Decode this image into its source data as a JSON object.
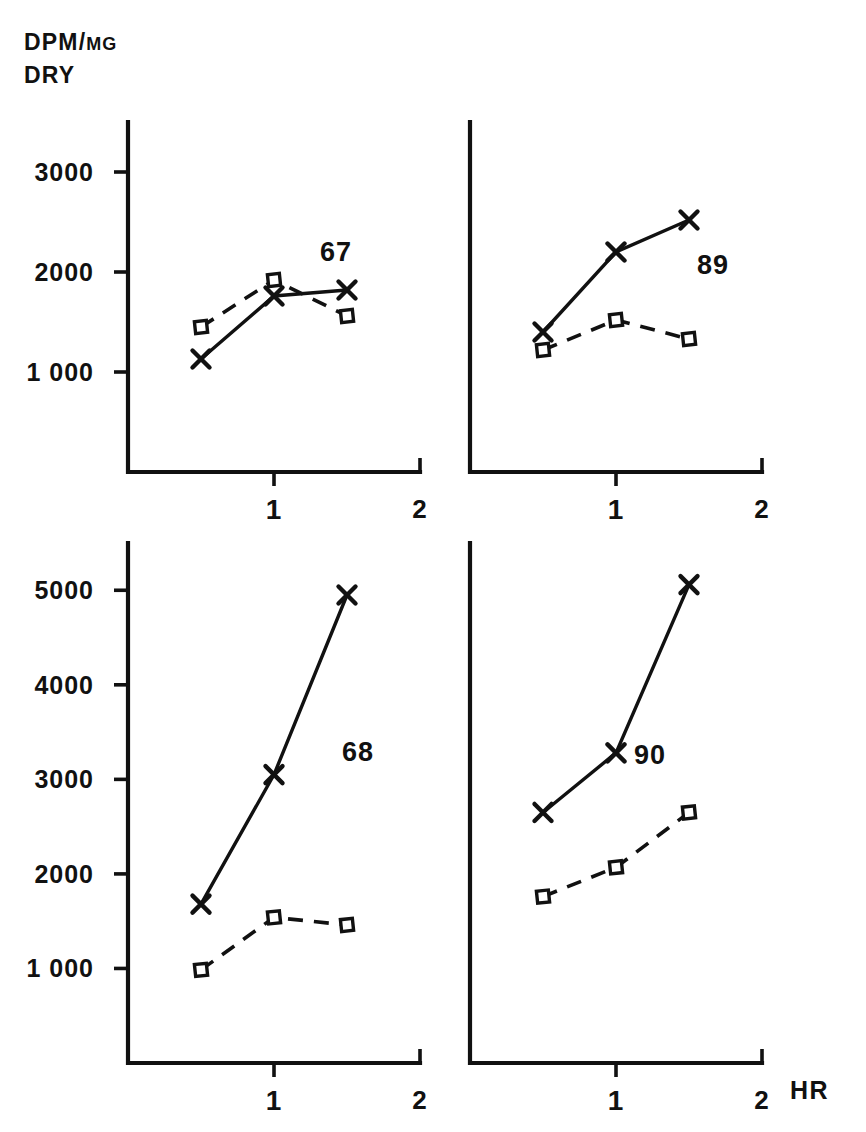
{
  "figure": {
    "y_axis_title_line1": "DPM/",
    "y_axis_title_unit": "MG",
    "y_axis_title_line2": "DRY",
    "x_axis_unit_label": "HR"
  },
  "chart_data": {
    "type": "line",
    "xlabel": "HR",
    "ylabel": "DPM/MG DRY",
    "grid": false,
    "legend_position": "none",
    "x": [
      0.5,
      1.0,
      1.5
    ],
    "panels": [
      {
        "label": "67",
        "row": 0,
        "col": 0,
        "xlim": [
          0,
          2
        ],
        "ylim": [
          0,
          3500
        ],
        "xticks": [
          "1",
          "2"
        ],
        "xtick_values": [
          1,
          2
        ],
        "yticks": [
          "3000",
          "2000",
          "1 000"
        ],
        "ytick_values": [
          3000,
          2000,
          1000
        ],
        "series": [
          {
            "name": "x-series",
            "marker": "x",
            "line": "solid",
            "values": [
              1130,
              1760,
              1820
            ]
          },
          {
            "name": "square-series",
            "marker": "square",
            "line": "dashed",
            "values": [
              1450,
              1920,
              1560
            ]
          }
        ]
      },
      {
        "label": "89",
        "row": 0,
        "col": 1,
        "xlim": [
          0,
          2
        ],
        "ylim": [
          0,
          3500
        ],
        "xticks": [
          "1",
          "2"
        ],
        "xtick_values": [
          1,
          2
        ],
        "yticks": [],
        "ytick_values": [],
        "series": [
          {
            "name": "x-series",
            "marker": "x",
            "line": "solid",
            "values": [
              1400,
              2200,
              2520
            ]
          },
          {
            "name": "square-series",
            "marker": "square",
            "line": "dashed",
            "values": [
              1220,
              1520,
              1330
            ]
          }
        ]
      },
      {
        "label": "68",
        "row": 1,
        "col": 0,
        "xlim": [
          0,
          2
        ],
        "ylim": [
          0,
          5500
        ],
        "xticks": [
          "1",
          "2"
        ],
        "xtick_values": [
          1,
          2
        ],
        "yticks": [
          "5000",
          "4000",
          "3000",
          "2000",
          "1 000"
        ],
        "ytick_values": [
          5000,
          4000,
          3000,
          2000,
          1000
        ],
        "series": [
          {
            "name": "x-series",
            "marker": "x",
            "line": "solid",
            "values": [
              1680,
              3050,
              4950
            ]
          },
          {
            "name": "square-series",
            "marker": "square",
            "line": "dashed",
            "values": [
              985,
              1540,
              1460
            ]
          }
        ]
      },
      {
        "label": "90",
        "row": 1,
        "col": 1,
        "xlim": [
          0,
          2
        ],
        "ylim": [
          0,
          5500
        ],
        "xticks": [
          "1",
          "2"
        ],
        "xtick_values": [
          1,
          2
        ],
        "yticks": [],
        "ytick_values": [],
        "series": [
          {
            "name": "x-series",
            "marker": "x",
            "line": "solid",
            "values": [
              2650,
              3280,
              5060
            ]
          },
          {
            "name": "square-series",
            "marker": "square",
            "line": "dashed",
            "values": [
              1760,
              2070,
              2650
            ]
          }
        ]
      }
    ]
  },
  "geometry": {
    "panels": [
      {
        "key": "67",
        "x0": 128,
        "x1": 420,
        "y_top": 122,
        "y_bottom": 472,
        "label_x": 336,
        "label_y": 252
      },
      {
        "key": "89",
        "x0": 470,
        "x1": 762,
        "y_top": 122,
        "y_bottom": 472,
        "label_x": 713,
        "label_y": 265
      },
      {
        "key": "68",
        "x0": 128,
        "x1": 420,
        "y_top": 543,
        "y_bottom": 1063,
        "label_x": 358,
        "label_y": 752
      },
      {
        "key": "90",
        "x0": 470,
        "x1": 762,
        "y_top": 543,
        "y_bottom": 1063,
        "label_x": 650,
        "label_y": 755
      }
    ],
    "hr_label_x": 790,
    "hr_label_y": 1090
  }
}
